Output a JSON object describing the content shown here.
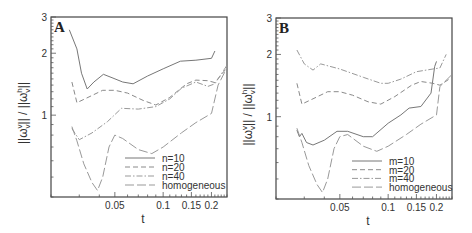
{
  "chart_data": [
    {
      "type": "line",
      "panel_label": "A",
      "xlabel": "t",
      "ylabel": "||ω_v^v|| / ||ω_v^h||",
      "xscale": "log",
      "yscale": "log",
      "xlim": [
        0.02,
        0.25
      ],
      "ylim": [
        0.4,
        3
      ],
      "xticks": [
        0.05,
        0.1,
        0.15,
        0.2
      ],
      "xtick_labels": [
        "0.05",
        "0.1",
        "0.15",
        "0.2"
      ],
      "yticks": [
        1,
        2,
        3
      ],
      "ytick_labels": [
        "1",
        "2",
        "3"
      ],
      "grid": false,
      "legend_position": "lower right",
      "series": [
        {
          "name": "n=10",
          "style": "solid",
          "points": [
            [
              0.026,
              2.6
            ],
            [
              0.029,
              2.1
            ],
            [
              0.031,
              1.6
            ],
            [
              0.0336,
              1.34
            ],
            [
              0.037,
              1.45
            ],
            [
              0.0424,
              1.58
            ],
            [
              0.048,
              1.52
            ],
            [
              0.056,
              1.45
            ],
            [
              0.065,
              1.42
            ],
            [
              0.08,
              1.55
            ],
            [
              0.1,
              1.68
            ],
            [
              0.128,
              1.83
            ],
            [
              0.16,
              1.85
            ],
            [
              0.2,
              1.89
            ],
            [
              0.21,
              2.05
            ]
          ]
        },
        {
          "name": "n=20",
          "style": "dashed",
          "points": [
            [
              0.027,
              1.45
            ],
            [
              0.029,
              1.15
            ],
            [
              0.034,
              1.22
            ],
            [
              0.042,
              1.32
            ],
            [
              0.05,
              1.32
            ],
            [
              0.06,
              1.28
            ],
            [
              0.075,
              1.18
            ],
            [
              0.09,
              1.12
            ],
            [
              0.11,
              1.22
            ],
            [
              0.14,
              1.42
            ],
            [
              0.16,
              1.48
            ],
            [
              0.19,
              1.47
            ],
            [
              0.21,
              1.44
            ],
            [
              0.25,
              1.7
            ]
          ]
        },
        {
          "name": "n=40",
          "style": "dashdot",
          "points": [
            [
              0.027,
              0.86
            ],
            [
              0.03,
              0.76
            ],
            [
              0.036,
              0.82
            ],
            [
              0.045,
              0.93
            ],
            [
              0.055,
              1.08
            ],
            [
              0.07,
              1.07
            ],
            [
              0.09,
              1.1
            ],
            [
              0.11,
              1.2
            ],
            [
              0.13,
              1.35
            ],
            [
              0.16,
              1.45
            ],
            [
              0.19,
              1.38
            ],
            [
              0.21,
              1.42
            ],
            [
              0.25,
              1.75
            ]
          ]
        },
        {
          "name": "homogeneous",
          "style": "longdash",
          "points": [
            [
              0.027,
              0.88
            ],
            [
              0.029,
              0.75
            ],
            [
              0.032,
              0.58
            ],
            [
              0.036,
              0.47
            ],
            [
              0.039,
              0.43
            ],
            [
              0.042,
              0.5
            ],
            [
              0.046,
              0.7
            ],
            [
              0.05,
              0.8
            ],
            [
              0.056,
              0.77
            ],
            [
              0.07,
              0.68
            ],
            [
              0.085,
              0.65
            ],
            [
              0.1,
              0.7
            ],
            [
              0.13,
              0.82
            ],
            [
              0.16,
              0.92
            ],
            [
              0.2,
              1.02
            ],
            [
              0.22,
              1.4
            ],
            [
              0.25,
              1.7
            ]
          ]
        }
      ]
    },
    {
      "type": "line",
      "panel_label": "B",
      "xlabel": "t",
      "ylabel": "||ω_v^v|| / ||ω_v^h||",
      "xscale": "log",
      "yscale": "log",
      "xlim": [
        0.02,
        0.25
      ],
      "ylim": [
        0.4,
        3
      ],
      "xticks": [
        0.05,
        0.1,
        0.15,
        0.2
      ],
      "xtick_labels": [
        "0.05",
        "0.1",
        "0.15",
        "0.2"
      ],
      "yticks": [
        1,
        2,
        3
      ],
      "ytick_labels": [
        "1",
        "2",
        "3"
      ],
      "grid": false,
      "legend_position": "lower right",
      "series": [
        {
          "name": "m=10",
          "style": "solid",
          "points": [
            [
              0.027,
              0.86
            ],
            [
              0.028,
              0.8
            ],
            [
              0.029,
              0.83
            ],
            [
              0.031,
              0.75
            ],
            [
              0.034,
              0.73
            ],
            [
              0.04,
              0.77
            ],
            [
              0.048,
              0.85
            ],
            [
              0.056,
              0.85
            ],
            [
              0.07,
              0.8
            ],
            [
              0.08,
              0.8
            ],
            [
              0.1,
              0.93
            ],
            [
              0.12,
              1.02
            ],
            [
              0.135,
              1.1
            ],
            [
              0.16,
              1.12
            ],
            [
              0.185,
              1.3
            ],
            [
              0.195,
              1.75
            ],
            [
              0.2,
              1.85
            ]
          ]
        },
        {
          "name": "m=20",
          "style": "dashed",
          "points": [
            [
              0.027,
              1.45
            ],
            [
              0.029,
              1.15
            ],
            [
              0.034,
              1.22
            ],
            [
              0.042,
              1.32
            ],
            [
              0.05,
              1.32
            ],
            [
              0.06,
              1.27
            ],
            [
              0.075,
              1.18
            ],
            [
              0.09,
              1.15
            ],
            [
              0.11,
              1.25
            ],
            [
              0.14,
              1.42
            ],
            [
              0.16,
              1.48
            ],
            [
              0.19,
              1.45
            ],
            [
              0.21,
              1.42
            ],
            [
              0.25,
              1.55
            ]
          ]
        },
        {
          "name": "m=40",
          "style": "dashdot",
          "points": [
            [
              0.027,
              2.1
            ],
            [
              0.03,
              1.8
            ],
            [
              0.034,
              1.68
            ],
            [
              0.038,
              1.8
            ],
            [
              0.05,
              1.7
            ],
            [
              0.07,
              1.55
            ],
            [
              0.09,
              1.45
            ],
            [
              0.1,
              1.45
            ],
            [
              0.12,
              1.52
            ],
            [
              0.15,
              1.65
            ],
            [
              0.19,
              1.7
            ],
            [
              0.21,
              1.72
            ],
            [
              0.23,
              2.0
            ]
          ]
        },
        {
          "name": "homogeneous",
          "style": "longdash",
          "points": [
            [
              0.027,
              0.88
            ],
            [
              0.029,
              0.75
            ],
            [
              0.032,
              0.58
            ],
            [
              0.036,
              0.47
            ],
            [
              0.039,
              0.43
            ],
            [
              0.042,
              0.5
            ],
            [
              0.046,
              0.7
            ],
            [
              0.05,
              0.8
            ],
            [
              0.056,
              0.82
            ],
            [
              0.07,
              0.72
            ],
            [
              0.085,
              0.68
            ],
            [
              0.1,
              0.72
            ],
            [
              0.13,
              0.82
            ],
            [
              0.16,
              0.92
            ],
            [
              0.2,
              1.02
            ],
            [
              0.21,
              1.4
            ],
            [
              0.25,
              1.6
            ]
          ]
        }
      ]
    }
  ]
}
